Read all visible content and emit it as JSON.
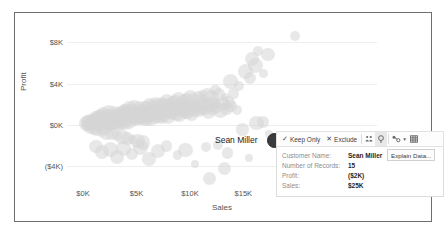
{
  "chart_data": {
    "type": "scatter",
    "title": "",
    "xlabel": "Sales",
    "ylabel": "Profit",
    "xticks": [
      "$0K",
      "$5K",
      "$10K",
      "$15K",
      "$20K",
      "$25K"
    ],
    "xtick_values": [
      0,
      5000,
      10000,
      15000,
      20000,
      25000
    ],
    "yticks": [
      "$8K",
      "$4K",
      "$0K",
      "($4K)"
    ],
    "ytick_values": [
      8000,
      4000,
      0,
      -4000
    ],
    "xlim": [
      -1500,
      27500
    ],
    "ylim": [
      -6000,
      9500
    ],
    "grid": true,
    "legend": "none",
    "marks": "circle",
    "mark_color": "#d6d6d6",
    "selected_color": "#3b3b3b",
    "selected_point": {
      "label": "Sean Miller",
      "x": 25000,
      "y": -2000
    },
    "points": [
      [
        300,
        120
      ],
      [
        420,
        260
      ],
      [
        520,
        90
      ],
      [
        640,
        330
      ],
      [
        700,
        -140
      ],
      [
        760,
        420
      ],
      [
        830,
        200
      ],
      [
        900,
        510
      ],
      [
        960,
        60
      ],
      [
        1020,
        -260
      ],
      [
        1080,
        380
      ],
      [
        1140,
        700
      ],
      [
        1200,
        150
      ],
      [
        1260,
        -430
      ],
      [
        1320,
        560
      ],
      [
        1380,
        250
      ],
      [
        1440,
        820
      ],
      [
        1500,
        -120
      ],
      [
        1560,
        430
      ],
      [
        1620,
        960
      ],
      [
        1680,
        300
      ],
      [
        1740,
        -610
      ],
      [
        1800,
        640
      ],
      [
        1860,
        180
      ],
      [
        1920,
        1080
      ],
      [
        1980,
        -240
      ],
      [
        2040,
        520
      ],
      [
        2100,
        880
      ],
      [
        2160,
        60
      ],
      [
        2220,
        -760
      ],
      [
        2280,
        700
      ],
      [
        2340,
        320
      ],
      [
        2400,
        1180
      ],
      [
        2460,
        -140
      ],
      [
        2520,
        600
      ],
      [
        2580,
        980
      ],
      [
        2640,
        180
      ],
      [
        2700,
        -880
      ],
      [
        2760,
        760
      ],
      [
        2820,
        420
      ],
      [
        2880,
        1280
      ],
      [
        2940,
        -60
      ],
      [
        3000,
        680
      ],
      [
        3060,
        1080
      ],
      [
        3120,
        260
      ],
      [
        3180,
        -1020
      ],
      [
        3240,
        840
      ],
      [
        3300,
        480
      ],
      [
        3360,
        1380
      ],
      [
        3420,
        120
      ],
      [
        3480,
        760
      ],
      [
        3540,
        1180
      ],
      [
        3600,
        340
      ],
      [
        3660,
        -1160
      ],
      [
        3720,
        920
      ],
      [
        3780,
        560
      ],
      [
        3840,
        1480
      ],
      [
        3900,
        200
      ],
      [
        3960,
        840
      ],
      [
        4020,
        1280
      ],
      [
        4080,
        420
      ],
      [
        4140,
        -1280
      ],
      [
        4200,
        1000
      ],
      [
        4260,
        640
      ],
      [
        4320,
        1580
      ],
      [
        4380,
        280
      ],
      [
        4440,
        920
      ],
      [
        4500,
        1380
      ],
      [
        4560,
        500
      ],
      [
        4620,
        -1420
      ],
      [
        4680,
        1080
      ],
      [
        4740,
        720
      ],
      [
        4800,
        1680
      ],
      [
        4860,
        360
      ],
      [
        4920,
        1000
      ],
      [
        4980,
        1480
      ],
      [
        5040,
        580
      ],
      [
        5100,
        -1560
      ],
      [
        5160,
        1160
      ],
      [
        5220,
        800
      ],
      [
        5280,
        1780
      ],
      [
        5340,
        440
      ],
      [
        5400,
        1080
      ],
      [
        5460,
        1580
      ],
      [
        5520,
        660
      ],
      [
        5580,
        -1680
      ],
      [
        5640,
        1240
      ],
      [
        5700,
        880
      ],
      [
        5760,
        1880
      ],
      [
        5820,
        520
      ],
      [
        5880,
        1160
      ],
      [
        5940,
        1680
      ],
      [
        6000,
        740
      ],
      [
        6120,
        1320
      ],
      [
        6180,
        960
      ],
      [
        6240,
        1980
      ],
      [
        6300,
        600
      ],
      [
        6420,
        1240
      ],
      [
        6480,
        1780
      ],
      [
        6540,
        820
      ],
      [
        6660,
        1400
      ],
      [
        6720,
        1040
      ],
      [
        6780,
        2080
      ],
      [
        6840,
        680
      ],
      [
        6960,
        1320
      ],
      [
        7020,
        1880
      ],
      [
        7080,
        900
      ],
      [
        7200,
        1480
      ],
      [
        7260,
        1120
      ],
      [
        7320,
        2180
      ],
      [
        7380,
        760
      ],
      [
        7500,
        1400
      ],
      [
        7560,
        1980
      ],
      [
        7620,
        980
      ],
      [
        7740,
        1560
      ],
      [
        7800,
        1200
      ],
      [
        7860,
        2280
      ],
      [
        7920,
        840
      ],
      [
        8040,
        1480
      ],
      [
        8100,
        2080
      ],
      [
        8160,
        1060
      ],
      [
        8280,
        1640
      ],
      [
        8340,
        1280
      ],
      [
        8400,
        2380
      ],
      [
        8460,
        920
      ],
      [
        8580,
        1560
      ],
      [
        8640,
        2180
      ],
      [
        8700,
        1140
      ],
      [
        8820,
        1720
      ],
      [
        8880,
        1360
      ],
      [
        8940,
        2480
      ],
      [
        9000,
        1000
      ],
      [
        9120,
        1640
      ],
      [
        9180,
        2280
      ],
      [
        9240,
        1220
      ],
      [
        9360,
        1800
      ],
      [
        9420,
        1440
      ],
      [
        9480,
        2580
      ],
      [
        9540,
        1080
      ],
      [
        9660,
        1720
      ],
      [
        9720,
        2380
      ],
      [
        9780,
        1300
      ],
      [
        9900,
        1880
      ],
      [
        9960,
        1520
      ],
      [
        10020,
        2680
      ],
      [
        10140,
        1160
      ],
      [
        10260,
        1800
      ],
      [
        10320,
        2480
      ],
      [
        10440,
        1380
      ],
      [
        10560,
        1960
      ],
      [
        10680,
        1600
      ],
      [
        10800,
        2780
      ],
      [
        10920,
        1240
      ],
      [
        11040,
        1880
      ],
      [
        11160,
        2580
      ],
      [
        11280,
        1460
      ],
      [
        11400,
        2040
      ],
      [
        11520,
        1680
      ],
      [
        11640,
        2880
      ],
      [
        11760,
        1320
      ],
      [
        11880,
        1960
      ],
      [
        12000,
        2660
      ],
      [
        12180,
        1540
      ],
      [
        12360,
        2120
      ],
      [
        12540,
        1760
      ],
      [
        12720,
        2960
      ],
      [
        12900,
        1400
      ],
      [
        13080,
        2040
      ],
      [
        13260,
        2740
      ],
      [
        13440,
        1620
      ],
      [
        13620,
        2200
      ],
      [
        13800,
        1840
      ],
      [
        14100,
        3040
      ],
      [
        14400,
        1480
      ],
      [
        1200,
        -2100
      ],
      [
        1800,
        -2600
      ],
      [
        2600,
        -2400
      ],
      [
        3200,
        -3100
      ],
      [
        3800,
        -2300
      ],
      [
        4600,
        -2800
      ],
      [
        5400,
        -2200
      ],
      [
        6200,
        -3300
      ],
      [
        7000,
        -2500
      ],
      [
        7800,
        -2000
      ],
      [
        8800,
        -2900
      ],
      [
        9600,
        -2400
      ],
      [
        10500,
        -3800
      ],
      [
        11500,
        -2100
      ],
      [
        12600,
        -1900
      ],
      [
        13500,
        -2700
      ],
      [
        13800,
        4200
      ],
      [
        14600,
        3800
      ],
      [
        15200,
        5200
      ],
      [
        15600,
        4600
      ],
      [
        15800,
        6400
      ],
      [
        16100,
        5800
      ],
      [
        16400,
        7200
      ],
      [
        16900,
        5000
      ],
      [
        17300,
        6800
      ],
      [
        14900,
        -400
      ],
      [
        16200,
        200
      ],
      [
        17400,
        -900
      ],
      [
        18800,
        -1400
      ],
      [
        15500,
        -3200
      ],
      [
        11800,
        -5200
      ],
      [
        19800,
        8600
      ],
      [
        16800,
        300
      ],
      [
        13200,
        -4200
      ],
      [
        12400,
        3400
      ],
      [
        11200,
        3000
      ]
    ]
  },
  "selection": {
    "label": "Sean Miller",
    "dot_name": "selected-mark"
  },
  "toolbar": {
    "keep_only": "Keep Only",
    "exclude": "Exclude",
    "check_glyph": "✓",
    "x_glyph": "✕",
    "group_icon": "group-members-icon",
    "describe_icon": "describe-mark-icon",
    "groupby_icon": "group-by-icon",
    "viewdata_icon": "view-data-icon",
    "caret_glyph": "▾"
  },
  "tooltip": {
    "rows": [
      {
        "key": "Customer Name:",
        "value": "Sean Miller"
      },
      {
        "key": "Number of Records:",
        "value": "15"
      },
      {
        "key": "Profit:",
        "value": "($2K)"
      },
      {
        "key": "Sales:",
        "value": "$25K"
      }
    ],
    "explain_button": "Explain Data..."
  }
}
